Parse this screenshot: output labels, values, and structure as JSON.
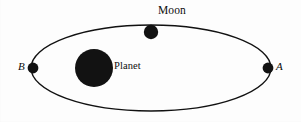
{
  "figure": {
    "kind": "orbit-diagram",
    "background_color": "#fdfdfd",
    "ink_color": "#0d0d0d",
    "width": 301,
    "height": 122
  },
  "labels": {
    "moon": "Moon",
    "planet": "Planet",
    "point_a": "A",
    "point_b": "B"
  },
  "geometry": {
    "orbit": {
      "name": "elliptical-orbit",
      "center_x": 151,
      "center_y": 68,
      "radius_x": 120,
      "radius_y": 43,
      "stroke_width": 1.4,
      "stroke_color": "#111111",
      "fill": "none"
    },
    "planet": {
      "name": "planet-body",
      "center_x": 94,
      "center_y": 68,
      "radius": 19,
      "fill_color": "#121212"
    },
    "moon": {
      "name": "moon-body",
      "center_x": 151,
      "center_y": 32,
      "radius": 7.2,
      "fill_color": "#121212"
    },
    "point_a": {
      "name": "orbit-point-a",
      "center_x": 268,
      "center_y": 68,
      "radius": 5.4,
      "fill_color": "#121212"
    },
    "point_b": {
      "name": "orbit-point-b",
      "center_x": 33,
      "center_y": 68,
      "radius": 5.4,
      "fill_color": "#121212"
    }
  }
}
